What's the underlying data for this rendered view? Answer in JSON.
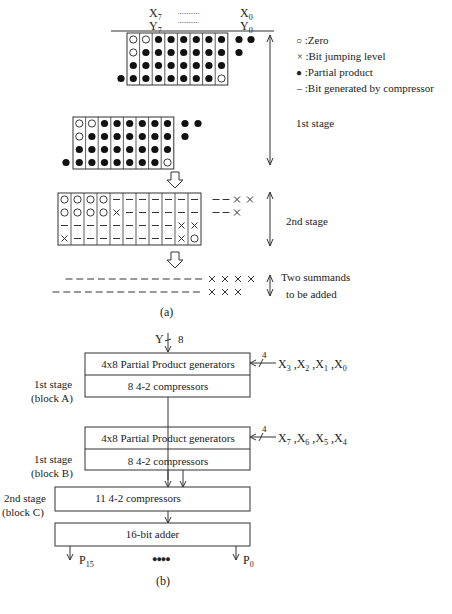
{
  "part_a": {
    "header": {
      "x_msb": "X",
      "x_msb_sub": "7",
      "x_lsb": "X",
      "x_lsb_sub": "0",
      "y_msb": "Y",
      "y_msb_sub": "7",
      "y_lsb": "Y",
      "y_lsb_sub": "0",
      "ellipsis": "............"
    },
    "legend": [
      {
        "symbol": "zero-circle",
        "glyph": "○",
        "label": ":Zero"
      },
      {
        "symbol": "cross",
        "glyph": "×",
        "label": ":Bit jumping level"
      },
      {
        "symbol": "filled-dot",
        "glyph": "●",
        "label": ":Partial product"
      },
      {
        "symbol": "dash",
        "glyph": "–",
        "label": ":Bit generated by compressor"
      }
    ],
    "stage_labels": {
      "first": "1st stage",
      "second": "2nd stage",
      "summands_line1": "Two summands",
      "summands_line2": "to be added"
    },
    "block_a_grid": [
      [
        "o",
        "o",
        "d",
        "d",
        "d",
        "d",
        "d",
        "d"
      ],
      [
        "o",
        "d",
        "d",
        "d",
        "d",
        "d",
        "d",
        "d"
      ],
      [
        "d",
        "d",
        "d",
        "d",
        "d",
        "d",
        "d",
        "d"
      ],
      [
        "d",
        "d",
        "d",
        "d",
        "d",
        "d",
        "d",
        "o"
      ]
    ],
    "block_b_grid": [
      [
        "o",
        "o",
        "d",
        "d",
        "d",
        "d",
        "d",
        "d"
      ],
      [
        "o",
        "d",
        "d",
        "d",
        "d",
        "d",
        "d",
        "d"
      ],
      [
        "d",
        "d",
        "d",
        "d",
        "d",
        "d",
        "d",
        "d"
      ],
      [
        "d",
        "d",
        "d",
        "d",
        "d",
        "d",
        "d",
        "o"
      ]
    ],
    "second_stage_grid": [
      [
        "o",
        "o",
        "o",
        "o",
        "-",
        "-",
        "-",
        "-",
        "-",
        "-",
        "-"
      ],
      [
        "o",
        "o",
        "o",
        "o",
        "x",
        "-",
        "-",
        "-",
        "-",
        "-",
        "-"
      ],
      [
        "-",
        "-",
        "-",
        "-",
        "-",
        "-",
        "-",
        "-",
        "-",
        "x",
        "x"
      ],
      [
        "x",
        "-",
        "-",
        "-",
        "-",
        "-",
        "-",
        "-",
        "-",
        "x",
        "o"
      ]
    ],
    "caption": "(a)"
  },
  "part_b": {
    "y_input": "Y",
    "y_width": "8",
    "block_a": {
      "top_label": "4x8 Partial Product generators",
      "bottom_label": "8 4-2 compressors",
      "side_line1": "1st stage",
      "side_line2": "(block A)",
      "bus_width": "4",
      "inputs": "X3 ,X2 ,X1 ,X0",
      "inputs_parts": [
        [
          "X",
          "3"
        ],
        [
          "X",
          "2"
        ],
        [
          "X",
          "1"
        ],
        [
          "X",
          "0"
        ]
      ]
    },
    "block_b": {
      "top_label": "4x8 Partial Product generators",
      "bottom_label": "8 4-2 compressors",
      "side_line1": "1st stage",
      "side_line2": "(block B)",
      "bus_width": "4",
      "inputs": "X7 ,X6 ,X5 ,X4",
      "inputs_parts": [
        [
          "X",
          "7"
        ],
        [
          "X",
          "6"
        ],
        [
          "X",
          "5"
        ],
        [
          "X",
          "4"
        ]
      ]
    },
    "block_c": {
      "label": "11 4-2 compressors",
      "side_line1": "2nd stage",
      "side_line2": "(block C)"
    },
    "adder": {
      "label": "16-bit adder",
      "out_msb": "P",
      "out_msb_sub": "15",
      "out_lsb": "P",
      "out_lsb_sub": "0",
      "dots": "●●●●"
    },
    "caption": "(b)"
  }
}
